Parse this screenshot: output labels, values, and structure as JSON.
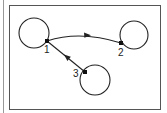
{
  "diagram": {
    "colors": {
      "stroke": "#222222",
      "frame": "#555555",
      "background": "#ffffff"
    },
    "nodes": [
      {
        "id": "1",
        "label": "1",
        "circle": {
          "cx": 34,
          "cy": 33,
          "r": 15
        },
        "point": {
          "x": 47,
          "y": 41
        },
        "label_pos": {
          "x": 44,
          "y": 53
        }
      },
      {
        "id": "2",
        "label": "2",
        "circle": {
          "cx": 134,
          "cy": 35,
          "r": 14
        },
        "point": {
          "x": 121,
          "y": 43
        },
        "label_pos": {
          "x": 118,
          "y": 56
        }
      },
      {
        "id": "3",
        "label": "3",
        "circle": {
          "cx": 95,
          "cy": 80,
          "r": 15
        },
        "point": {
          "x": 85,
          "y": 72
        },
        "label_pos": {
          "x": 73,
          "y": 77
        }
      }
    ],
    "edges": [
      {
        "from": "1",
        "to": "2",
        "type": "curved",
        "arrow_direction": "right"
      },
      {
        "from": "3",
        "to": "1",
        "type": "straight",
        "arrow_direction": "up-left"
      }
    ]
  }
}
